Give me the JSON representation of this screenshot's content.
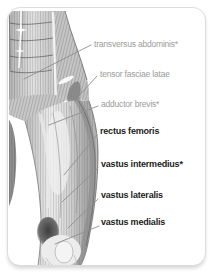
{
  "figure": {
    "type": "anatomy-diagram",
    "labels": [
      {
        "text": "transversus abdominis*",
        "emphasis": "muted"
      },
      {
        "text": "tensor fasciae latae",
        "emphasis": "muted"
      },
      {
        "text": "adductor brevis*",
        "emphasis": "muted"
      },
      {
        "text": "rectus femoris",
        "emphasis": "bold"
      },
      {
        "text": "vastus intermedius*",
        "emphasis": "bold"
      },
      {
        "text": "vastus lateralis",
        "emphasis": "bold"
      },
      {
        "text": "vastus medialis",
        "emphasis": "bold"
      }
    ],
    "colors": {
      "muted_label": "#9b9b9b",
      "bold_label": "#1c1c1c",
      "leader_line": "#8f8f8f",
      "card_border": "#dcdcdc",
      "background": "#ffffff"
    }
  }
}
